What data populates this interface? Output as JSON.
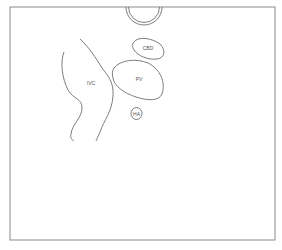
{
  "diagram": {
    "type": "anatomical-ultrasound-sketch",
    "frame": {
      "stroke": "#8a8a8a"
    },
    "line_color": "#6e6e6e",
    "structures": [
      {
        "id": "probe",
        "label": ""
      },
      {
        "id": "cbd",
        "label": "CBD"
      },
      {
        "id": "pv",
        "label": "PV"
      },
      {
        "id": "ivc",
        "label": "IVC"
      },
      {
        "id": "ha",
        "label": "HA"
      }
    ]
  },
  "labels": {
    "cbd": "CBD",
    "pv": "PV",
    "ivc": "IVC",
    "ha": "HA"
  }
}
